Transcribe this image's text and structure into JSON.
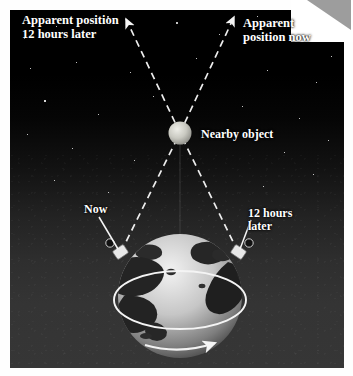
{
  "figure": {
    "background_color": "#000000",
    "panel_color_bottom": "#363636"
  },
  "labels": {
    "apparent_position_later": "Apparent position\n12 hours later",
    "apparent_position_now": "Apparent\nposition now",
    "nearby_object": "Nearby object",
    "observer_now": "Now",
    "observer_later": "12 hours\nlater"
  },
  "elements": {
    "nearby_object_icon": "sphere",
    "earth_icon": "globe",
    "rotation_arrow": "rotation-arrow-eastward",
    "observer_marker_left": "telescope-marker",
    "observer_marker_right": "telescope-marker",
    "sight_line_style": "dashed",
    "leader_line_style": "solid"
  },
  "colors": {
    "line": "#f2f2f2",
    "object": "#c8c8c0",
    "land": "#2a2a2a",
    "ocean": "#b9b9b9",
    "star": "#ffffff"
  },
  "geometry": {
    "object_x": 180,
    "object_y": 133,
    "earth_center_x": 180,
    "earth_center_y": 296,
    "earth_radius": 62,
    "observer_left_x": 121,
    "observer_left_y": 252,
    "observer_right_x": 238,
    "observer_right_y": 252
  }
}
